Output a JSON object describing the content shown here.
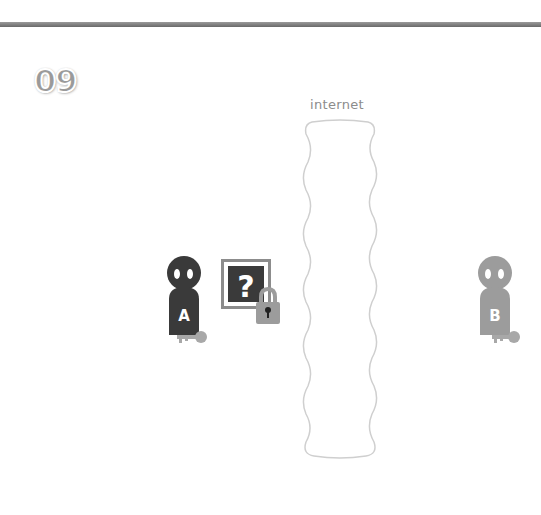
{
  "step_number": "09",
  "internet_label": "internet",
  "actors": [
    {
      "label": "A",
      "color": "#3a3a3a",
      "has_key": true
    },
    {
      "label": "B",
      "color": "#9c9c9c",
      "has_key": true
    }
  ],
  "message": {
    "glyph": "?",
    "locked": true,
    "box_color": "#3a3a3a",
    "lock_color": "#9c9c9c"
  },
  "colors": {
    "topbar": "#7a7a7a",
    "dark": "#3a3a3a",
    "light": "#9c9c9c",
    "key": "#a8a8a8",
    "cloud_border": "#cfcfcf"
  }
}
